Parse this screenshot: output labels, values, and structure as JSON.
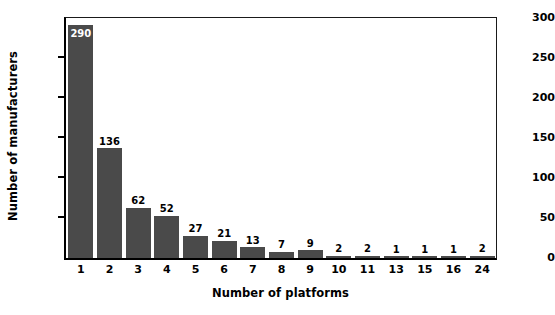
{
  "chart_data": {
    "type": "bar",
    "title": "",
    "xlabel": "Number of platforms",
    "ylabel": "Number of manufacturers",
    "categories": [
      "1",
      "2",
      "3",
      "4",
      "5",
      "6",
      "7",
      "8",
      "9",
      "10",
      "11",
      "13",
      "15",
      "16",
      "24"
    ],
    "values": [
      290,
      136,
      62,
      52,
      27,
      21,
      13,
      7,
      9,
      2,
      2,
      1,
      1,
      1,
      2
    ],
    "data_labels": [
      "290",
      "136",
      "62",
      "52",
      "27",
      "21",
      "13",
      "7",
      "9",
      "2",
      "2",
      "1",
      "1",
      "1",
      "2"
    ],
    "label_placement": [
      "inside",
      "above",
      "above",
      "above",
      "above",
      "above",
      "above",
      "above",
      "above",
      "above",
      "above",
      "above",
      "above",
      "above",
      "above"
    ],
    "ylim": [
      0,
      300
    ],
    "yticks": [
      0,
      50,
      100,
      150,
      200,
      250,
      300
    ],
    "ytick_labels": [
      "0",
      "50",
      "100",
      "150",
      "200",
      "250",
      "300"
    ],
    "grid": false,
    "legend": false,
    "legend_position": "none",
    "bar_color": "#4a4a4a",
    "axis_color": "#000000",
    "label_color": "#000000",
    "inside_label_color": "#ffffff",
    "background_color": "#ffffff"
  }
}
